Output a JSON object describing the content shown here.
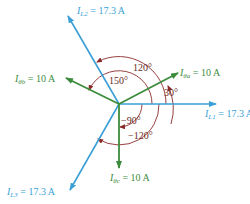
{
  "diagram": {
    "type": "phasor-diagram",
    "colors": {
      "line_current": "#3a9fd6",
      "phase_current": "#3c8c3c",
      "angle_arc": "#8b2a2a",
      "angle_text": "#6b2a24"
    },
    "origin": {
      "x": 119,
      "y": 104
    },
    "phasors": [
      {
        "id": "IL1",
        "symbol": "I",
        "sub": "L1",
        "eq": "=",
        "value": "17.3 A",
        "kind": "line",
        "tip": {
          "x": 216,
          "y": 104
        }
      },
      {
        "id": "IL2",
        "symbol": "I",
        "sub": "L2",
        "eq": "=",
        "value": "17.3 A",
        "kind": "line",
        "tip": {
          "x": 68,
          "y": 16
        }
      },
      {
        "id": "IL3",
        "symbol": "I",
        "sub": "L3",
        "eq": "=",
        "value": "17.3 A",
        "kind": "line",
        "tip": {
          "x": 70,
          "y": 190
        }
      },
      {
        "id": "Itha",
        "symbol": "I",
        "sub": "θa",
        "eq": "=",
        "value": "10 A",
        "kind": "phase",
        "tip": {
          "x": 178,
          "y": 73
        }
      },
      {
        "id": "Ithb",
        "symbol": "I",
        "sub": "θb",
        "eq": "=",
        "value": "10 A",
        "kind": "phase",
        "tip": {
          "x": 66,
          "y": 78
        }
      },
      {
        "id": "Ithc",
        "symbol": "I",
        "sub": "θc",
        "eq": "=",
        "value": "10 A",
        "kind": "phase",
        "tip": {
          "x": 119,
          "y": 168
        }
      }
    ],
    "angles": [
      {
        "label": "120°"
      },
      {
        "label": "150°"
      },
      {
        "label": "30°"
      },
      {
        "label": "−90°"
      },
      {
        "label": "−120°"
      }
    ]
  }
}
